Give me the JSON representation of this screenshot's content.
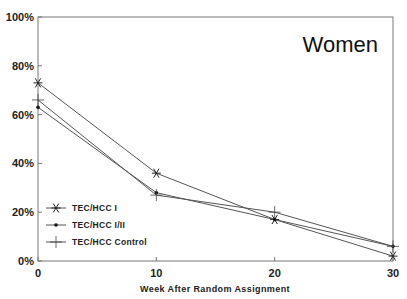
{
  "chart_data": {
    "type": "line",
    "title": "Women",
    "xlabel": "Week After Random Assignment",
    "ylabel": "",
    "x": [
      0,
      10,
      20,
      30
    ],
    "xticks": [
      "0",
      "10",
      "20",
      "30"
    ],
    "yticks": [
      "0%",
      "20%",
      "40%",
      "60%",
      "80%",
      "100%"
    ],
    "xlim": [
      0,
      30
    ],
    "ylim": [
      0,
      100
    ],
    "grid": false,
    "legend_position": "lower-left",
    "series": [
      {
        "name": "TEC/HCC I",
        "marker": "asterisk",
        "values": [
          73,
          36,
          17,
          2
        ]
      },
      {
        "name": "TEC/HCC I/II",
        "marker": "dot",
        "values": [
          63,
          28,
          17,
          6
        ]
      },
      {
        "name": "TEC/HCC Control",
        "marker": "plus",
        "values": [
          66,
          27,
          20,
          6
        ]
      }
    ]
  },
  "colors": {
    "line": "#555555",
    "axis": "#777777",
    "text": "#222222"
  }
}
